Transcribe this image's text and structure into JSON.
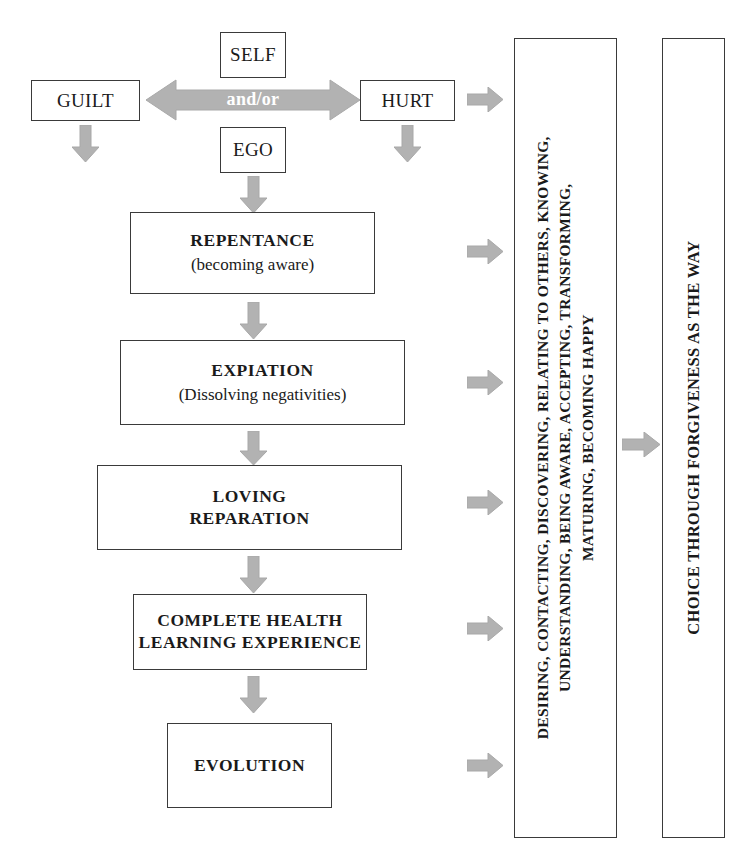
{
  "diagram": {
    "title": "Choice Through Forgiveness As The Way",
    "colors": {
      "arrow_fill": "#b2b2b2",
      "arrow_stroke": "#a0a0a0",
      "box_border": "#3a3a3a",
      "text": "#1a1a1a",
      "andor_text": "#ffffff",
      "background": "#ffffff"
    },
    "source_boxes": [
      {
        "id": "guilt",
        "label": "GUILT"
      },
      {
        "id": "self",
        "label": "SELF"
      },
      {
        "id": "ego",
        "label": "EGO"
      },
      {
        "id": "hurt",
        "label": "HURT"
      }
    ],
    "bidirectional_arrow_label": "and/or",
    "stages": [
      {
        "id": "repentance",
        "title": "REPENTANCE",
        "subtitle": "(becoming aware)"
      },
      {
        "id": "expiation",
        "title": "EXPIATION",
        "subtitle": "(Dissolving negativities)"
      },
      {
        "id": "loving-reparation",
        "title": "LOVING",
        "subtitle": "REPARATION"
      },
      {
        "id": "complete-health",
        "title": "COMPLETE HEALTH",
        "subtitle": "LEARNING EXPERIENCE"
      },
      {
        "id": "evolution",
        "title": "EVOLUTION",
        "subtitle": ""
      }
    ],
    "process_column": {
      "id": "process-qualities",
      "lines": [
        "DESIRING, CONTACTING, DISCOVERING, RELATING TO OTHERS, KNOWING,",
        "UNDERSTANDING, BEING AWARE, ACCEPTING, TRANSFORMING,",
        "MATURING, BECOMING HAPPY"
      ]
    },
    "outcome_column": {
      "id": "outcome",
      "lines": [
        "CHOICE THROUGH FORGIVENESS AS THE WAY"
      ]
    }
  }
}
